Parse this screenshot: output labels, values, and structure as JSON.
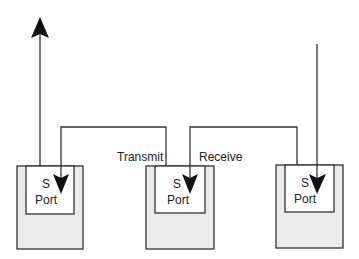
{
  "diagram": {
    "ports": [
      {
        "line1": "S",
        "line2": "Port"
      },
      {
        "line1": "S",
        "line2": "Port"
      },
      {
        "line1": "S",
        "line2": "Port"
      }
    ],
    "labels": {
      "transmit": "Transmit",
      "receive": "Receive"
    },
    "colors": {
      "stroke": "#333333",
      "box_fill": "#ebebeb",
      "inner_fill": "#ffffff",
      "arrow": "#111111"
    }
  }
}
